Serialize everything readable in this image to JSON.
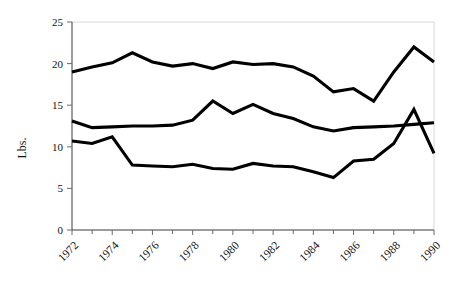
{
  "chart_data": {
    "type": "line",
    "title": "",
    "xlabel": "",
    "ylabel": "Lbs.",
    "xlim": [
      1972,
      1990
    ],
    "ylim": [
      0,
      25
    ],
    "grid": false,
    "legend": "none",
    "y_ticks": [
      0,
      5,
      10,
      15,
      20,
      25
    ],
    "y_tick_labels": [
      "0",
      "5",
      "10",
      "15",
      "20",
      "25"
    ],
    "x": [
      1972,
      1973,
      1974,
      1975,
      1976,
      1977,
      1978,
      1979,
      1980,
      1981,
      1982,
      1983,
      1984,
      1985,
      1986,
      1987,
      1988,
      1989,
      1990
    ],
    "x_tick_labels": [
      "1972",
      "1974",
      "1976",
      "1978",
      "1980",
      "1982",
      "1984",
      "1986",
      "1988",
      "1990"
    ],
    "x_tick_years": [
      1972,
      1974,
      1976,
      1978,
      1980,
      1982,
      1984,
      1986,
      1988,
      1990
    ],
    "x_minor_years": [
      1973,
      1975,
      1977,
      1979,
      1981,
      1983,
      1985,
      1987,
      1989
    ],
    "series": [
      {
        "name": "series-top",
        "color": "#000000",
        "values": [
          19.0,
          19.6,
          20.1,
          21.3,
          20.2,
          19.7,
          20.0,
          19.4,
          20.2,
          19.9,
          20.0,
          19.6,
          18.5,
          16.6,
          17.0,
          15.5,
          19.0,
          22.0,
          20.2
        ]
      },
      {
        "name": "series-middle",
        "color": "#000000",
        "values": [
          13.1,
          12.3,
          12.4,
          12.5,
          12.5,
          12.6,
          13.2,
          15.5,
          14.0,
          15.1,
          14.0,
          13.4,
          12.4,
          11.9,
          12.3,
          12.4,
          12.5,
          12.7,
          12.9
        ]
      },
      {
        "name": "series-bottom",
        "color": "#000000",
        "values": [
          10.7,
          10.4,
          11.2,
          7.8,
          7.7,
          7.6,
          7.9,
          7.4,
          7.3,
          8.0,
          7.7,
          7.6,
          7.0,
          6.3,
          8.3,
          8.5,
          10.4,
          14.5,
          9.2
        ]
      }
    ]
  },
  "axis": {
    "y_label": "Lbs."
  }
}
